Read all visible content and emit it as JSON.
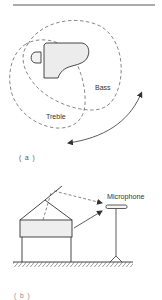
{
  "figure": {
    "panel_a": {
      "caption": "( a )",
      "labels": {
        "bass": "Bass",
        "treble": "Treble"
      },
      "elements": [
        "grand-piano-top-view",
        "piano-bench",
        "bass-radiation-contour",
        "treble-radiation-contour",
        "curved-double-arrow"
      ]
    },
    "panel_b": {
      "caption": "( b )",
      "labels": {
        "microphone": "Microphone"
      },
      "elements": [
        "grand-piano-side-view",
        "open-lid",
        "microphone-on-stand",
        "reflected-sound-path",
        "direct-sound-path",
        "floor"
      ]
    }
  },
  "colors": {
    "line": "#333333",
    "fill": "#eeeeee",
    "background": "#ffffff"
  }
}
